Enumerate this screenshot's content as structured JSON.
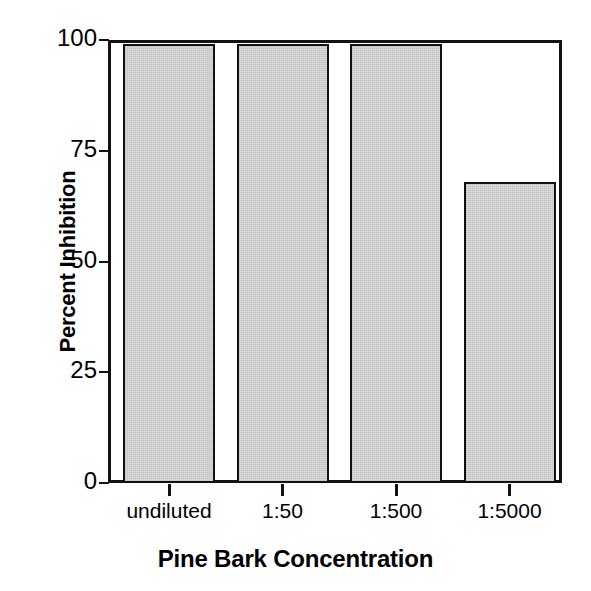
{
  "chart_data": {
    "type": "bar",
    "title": "",
    "xlabel": "Pine Bark Concentration",
    "ylabel": "Percent Inhibition",
    "categories": [
      "undiluted",
      "1:50",
      "1:500",
      "1:5000"
    ],
    "values": [
      99,
      99,
      99,
      68
    ],
    "ylim": [
      0,
      100
    ],
    "yticks": [
      0,
      25,
      50,
      75,
      100
    ],
    "ytick_labels": [
      "0",
      "25",
      "50",
      "75",
      "100"
    ],
    "grid": false,
    "legend": null,
    "series": [
      {
        "name": "Percent Inhibition",
        "values": [
          99,
          99,
          99,
          68
        ]
      }
    ],
    "colors": {
      "bar_fill": "#d6d6d6",
      "bar_edge": "#111111",
      "axis": "#111111",
      "text": "#000000",
      "background": "#ffffff"
    }
  },
  "axes": {
    "y": {
      "title": "Percent Inhibition",
      "ticks": [
        {
          "label": "100",
          "value": 100
        },
        {
          "label": "75",
          "value": 75
        },
        {
          "label": "50",
          "value": 50
        },
        {
          "label": "25",
          "value": 25
        },
        {
          "label": "0",
          "value": 0
        }
      ]
    },
    "x": {
      "title": "Pine Bark Concentration",
      "ticks": [
        {
          "label": "undiluted"
        },
        {
          "label": "1:50"
        },
        {
          "label": "1:500"
        },
        {
          "label": "1:5000"
        }
      ]
    }
  }
}
